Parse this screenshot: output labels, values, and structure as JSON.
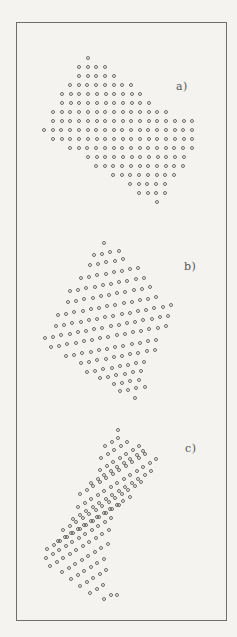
{
  "figure": {
    "panels": [
      {
        "id": "a",
        "label": "a)",
        "label_pos": [
          176,
          88
        ],
        "dx": [
          8.7,
          0
        ],
        "rows": [
          {
            "start": [
              88,
              58
            ],
            "count": 1
          },
          {
            "start": [
              79,
              67
            ],
            "count": 4
          },
          {
            "start": [
              79,
              76
            ],
            "count": 5
          },
          {
            "start": [
              70,
              85
            ],
            "count": 8
          },
          {
            "start": [
              62,
              94
            ],
            "count": 10
          },
          {
            "start": [
              62,
              103
            ],
            "count": 11
          },
          {
            "start": [
              53,
              112
            ],
            "count": 14
          },
          {
            "start": [
              53,
              121
            ],
            "count": 17
          },
          {
            "start": [
              44,
              130
            ],
            "count": 18
          },
          {
            "start": [
              53,
              139
            ],
            "count": 17
          },
          {
            "start": [
              70,
              148
            ],
            "count": 15
          },
          {
            "start": [
              88,
              157
            ],
            "count": 12
          },
          {
            "start": [
              96,
              166
            ],
            "count": 11
          },
          {
            "start": [
              113,
              175
            ],
            "count": 8
          },
          {
            "start": [
              130,
              184
            ],
            "count": 5
          },
          {
            "start": [
              139,
              193
            ],
            "count": 4
          },
          {
            "start": [
              157,
              202
            ],
            "count": 1
          }
        ]
      },
      {
        "id": "b",
        "label": "b)",
        "label_pos": [
          184,
          268
        ],
        "dx": [
          8.2,
          -1.5
        ],
        "rows": [
          {
            "start": [
              104,
              243
            ],
            "count": 1
          },
          {
            "start": [
              94,
              255
            ],
            "count": 4
          },
          {
            "start": [
              90,
              265
            ],
            "count": 5
          },
          {
            "start": [
              81,
              278
            ],
            "count": 8
          },
          {
            "start": [
              70,
              291
            ],
            "count": 10
          },
          {
            "start": [
              68,
              302
            ],
            "count": 11
          },
          {
            "start": [
              58,
              315
            ],
            "count": 13
          },
          {
            "start": [
              56,
              326
            ],
            "count": 15
          },
          {
            "start": [
              45,
              338
            ],
            "count": 16
          },
          {
            "start": [
              51,
              347
            ],
            "count": 15
          },
          {
            "start": [
              66,
              356
            ],
            "count": 12
          },
          {
            "start": [
              81,
              363
            ],
            "count": 10
          },
          {
            "start": [
              87,
              372
            ],
            "count": 8
          },
          {
            "start": [
              100,
              378
            ],
            "count": 6
          },
          {
            "start": [
              114,
              384
            ],
            "count": 4
          },
          {
            "start": [
              120,
              391
            ],
            "count": 4
          },
          {
            "start": [
              135,
              398
            ],
            "count": 1
          }
        ]
      },
      {
        "id": "c",
        "label": "c)",
        "label_pos": [
          185,
          450
        ],
        "dx": [
          6.5,
          -4.0
        ],
        "rows": [
          {
            "start": [
              118,
              430
            ],
            "count": 1
          },
          {
            "start": [
              105,
              446
            ],
            "count": 3
          },
          {
            "start": [
              101,
              458
            ],
            "count": 5
          },
          {
            "start": [
              100,
              470
            ],
            "count": 7
          },
          {
            "start": [
              91,
              483
            ],
            "count": 9
          },
          {
            "start": [
              80,
              494
            ],
            "count": 11
          },
          {
            "start": [
              78,
              507
            ],
            "count": 13
          },
          {
            "start": [
              73,
              519
            ],
            "count": 13
          },
          {
            "start": [
              63,
              530
            ],
            "count": 13
          },
          {
            "start": [
              58,
              541
            ],
            "count": 12
          },
          {
            "start": [
              47,
              549
            ],
            "count": 12
          },
          {
            "start": [
              46,
              558
            ],
            "count": 11
          },
          {
            "start": [
              50,
              566
            ],
            "count": 10
          },
          {
            "start": [
              62,
              572
            ],
            "count": 8
          },
          {
            "start": [
              71,
              579
            ],
            "count": 6
          },
          {
            "start": [
              80,
              586
            ],
            "count": 5
          },
          {
            "start": [
              90,
              593
            ],
            "count": 3
          },
          {
            "start": [
              104,
              599
            ],
            "count": 2
          },
          {
            "start": [
              117,
              595
            ],
            "count": 1
          }
        ]
      }
    ],
    "colors": {
      "dot": "#6a6a6a",
      "frame": "#6e6e6e",
      "paper": "#f4f3f0"
    }
  }
}
